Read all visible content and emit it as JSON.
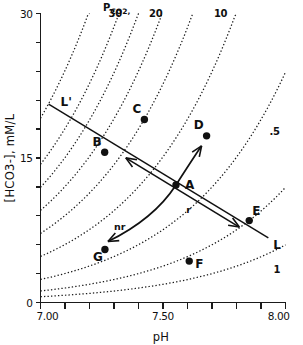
{
  "chart_data": {
    "type": "line",
    "title": "",
    "xlabel": "pH",
    "ylabel": "[HCO3-], mM/L",
    "xlim": [
      7.0,
      8.0
    ],
    "ylim": [
      0,
      30
    ],
    "grid": false,
    "legend_position": "none",
    "x_ticks": [
      7.0,
      7.1,
      7.2,
      7.3,
      7.4,
      7.5,
      7.6,
      7.7,
      7.8,
      7.9,
      8.0
    ],
    "x_tick_labels": [
      "7.00",
      "",
      "",
      "",
      "",
      "7.50",
      "",
      "",
      "",
      "",
      "8.00"
    ],
    "y_ticks": [
      0,
      3,
      6,
      9,
      12,
      15,
      18,
      21,
      24,
      27,
      30
    ],
    "y_tick_labels": [
      "0",
      "",
      "",
      "",
      "",
      "15",
      "",
      "",
      "",
      "",
      "30"
    ],
    "isobar_family_label": "P",
    "isobar_family_sub": "CO2,",
    "isobar_curves": [
      {
        "label": "30",
        "pco2": 30,
        "label_x": 7.305,
        "label_y": 29.6
      },
      {
        "label": "20",
        "pco2": 20,
        "label_x": 7.47,
        "label_y": 29.6
      },
      {
        "label": "10",
        "pco2": 10,
        "label_x": 7.735,
        "label_y": 29.6
      },
      {
        "label": "",
        "pco2": 40
      },
      {
        "label": "",
        "pco2": 50
      },
      {
        "label": "",
        "pco2": 60
      },
      {
        "label": "",
        "pco2": 80
      },
      {
        "label": ".5",
        "pco2": 5,
        "label_x": 7.955,
        "label_y": 17.4
      },
      {
        "label": "1",
        "pco2": 2.5,
        "label_x": 7.965,
        "label_y": 3.1
      }
    ],
    "buffer_line": {
      "start_label": "L'",
      "end_label": "L",
      "start": {
        "x": 7.033,
        "y": 20.6
      },
      "end": {
        "x": 7.93,
        "y": 6.7
      }
    },
    "trajectory_labels": [
      {
        "label": "nr",
        "x": 7.3,
        "y": 7.5
      },
      {
        "label": "r",
        "x": 7.595,
        "y": 9.3
      }
    ],
    "points": [
      {
        "label": "A",
        "x": 7.553,
        "y": 12.2,
        "label_dx": 9,
        "label_dy": 4
      },
      {
        "label": "B",
        "x": 7.262,
        "y": 15.6,
        "label_dx": -3,
        "label_dy": -6
      },
      {
        "label": "C",
        "x": 7.424,
        "y": 19.0,
        "label_dx": -3,
        "label_dy": -6
      },
      {
        "label": "D",
        "x": 7.678,
        "y": 17.3,
        "label_dx": -3,
        "label_dy": -7
      },
      {
        "label": "E",
        "x": 7.852,
        "y": 8.5,
        "label_dx": 3,
        "label_dy": -6
      },
      {
        "label": "F",
        "x": 7.607,
        "y": 4.3,
        "label_dx": 6,
        "label_dy": 7
      },
      {
        "label": "G",
        "x": 7.263,
        "y": 5.5,
        "label_dx": -2,
        "label_dy": 11
      }
    ],
    "colors": {
      "axis": "#1a1a1a",
      "isobar": "#1a1a1a",
      "point": "#111111",
      "background": "#ffffff"
    }
  },
  "figure": {
    "x_axis_title": "pH",
    "y_axis_title": "[HCO3-], mM/L"
  }
}
